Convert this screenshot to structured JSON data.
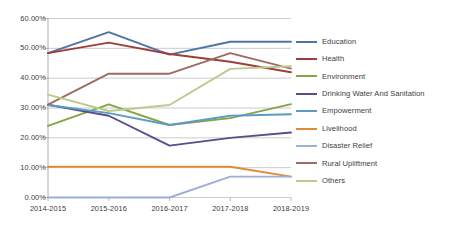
{
  "chart_data": {
    "type": "line",
    "title": "",
    "subtitle": "",
    "xlabel": "",
    "ylabel": "",
    "categories": [
      "2014-2015",
      "2015-2016",
      "2016-2017",
      "2017-2018",
      "2018-2019"
    ],
    "ylim": [
      0,
      60
    ],
    "y_tick_labels": [
      "0.00%",
      "10.00%",
      "20.00%",
      "30.00%",
      "40.00%",
      "50.00%",
      "60.00%"
    ],
    "y_tick_values": [
      0,
      10,
      20,
      30,
      40,
      50,
      60
    ],
    "y_axis_format": "percent",
    "grid": "horizontal",
    "legend_position": "right",
    "series": [
      {
        "name": "Education",
        "color": "#4F72A8",
        "values": [
          48.4,
          55.4,
          47.9,
          52.2,
          52.2
        ]
      },
      {
        "name": "Health",
        "color": "#9E3D3B",
        "values": [
          48.4,
          51.9,
          48.1,
          45.5,
          42.0
        ]
      },
      {
        "name": "Environment",
        "color": "#8FA martin"
      }
    ]
  }
}
